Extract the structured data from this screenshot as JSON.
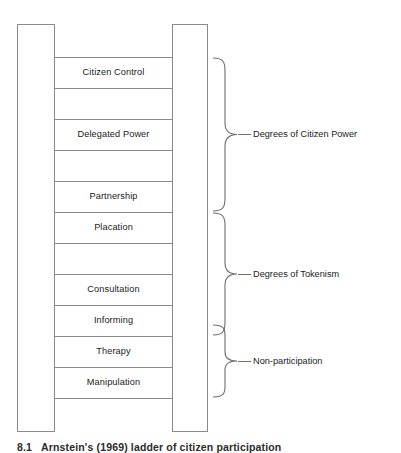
{
  "figure": {
    "caption_number": "8.1",
    "caption_text": "Arnstein's (1969) ladder of citizen participation",
    "background_color": "#ffffff",
    "line_color": "#8a8a8a",
    "text_color": "#1b1b1b"
  },
  "ladder": {
    "rail_left_name": "left-rail",
    "rail_right_name": "right-rail",
    "rungs": [
      {
        "index": 1,
        "label": "Citizen Control",
        "labeled": true
      },
      {
        "index": 2,
        "label": "",
        "labeled": false
      },
      {
        "index": 3,
        "label": "Delegated Power",
        "labeled": true
      },
      {
        "index": 4,
        "label": "",
        "labeled": false
      },
      {
        "index": 5,
        "label": "Partnership",
        "labeled": true
      },
      {
        "index": 6,
        "label": "",
        "labeled": false
      },
      {
        "index": 7,
        "label": "Placation",
        "labeled": true
      },
      {
        "index": 8,
        "label": "",
        "labeled": false
      },
      {
        "index": 9,
        "label": "Consultation",
        "labeled": true
      },
      {
        "index": 10,
        "label": "",
        "labeled": false
      },
      {
        "index": 11,
        "label": "Informing",
        "labeled": true
      },
      {
        "index": 12,
        "label": "",
        "labeled": false
      },
      {
        "index": 13,
        "label": "Therapy",
        "labeled": true
      },
      {
        "index": 14,
        "label": "",
        "labeled": false
      },
      {
        "index": 15,
        "label": "Manipulation",
        "labeled": true
      },
      {
        "index": 16,
        "label": "",
        "labeled": false
      }
    ]
  },
  "groups": [
    {
      "id": "citizen-power",
      "label": "Degrees of Citizen Power",
      "covers": [
        "Citizen Control",
        "Delegated Power",
        "Partnership"
      ]
    },
    {
      "id": "tokenism",
      "label": "Degrees of Tokenism",
      "covers": [
        "Placation",
        "Consultation",
        "Informing"
      ]
    },
    {
      "id": "non-participation",
      "label": "Non-participation",
      "covers": [
        "Therapy",
        "Manipulation"
      ]
    }
  ]
}
